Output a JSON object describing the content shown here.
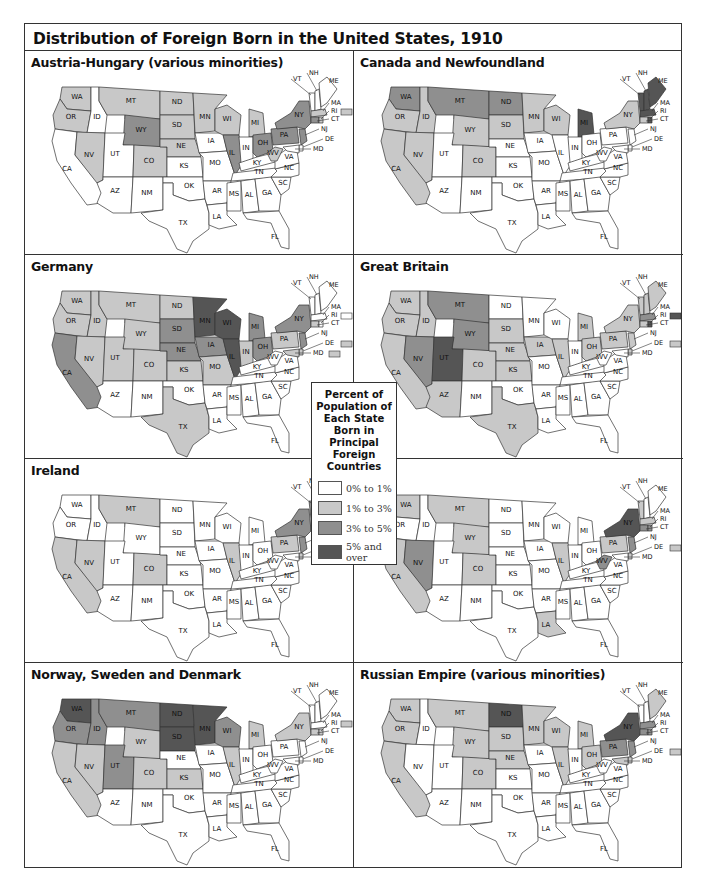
{
  "title": "Distribution of Foreign Born in the United States, 1910",
  "legend": {
    "title_lines": [
      "Percent of",
      "Population of",
      "Each State",
      "Born in",
      "Principal",
      "Foreign",
      "Countries"
    ],
    "items": [
      {
        "label": "0% to 1%",
        "color": "#ffffff"
      },
      {
        "label": "1% to 3%",
        "color": "#c8c8c8"
      },
      {
        "label": "3% to 5%",
        "color": "#8f8f8f"
      },
      {
        "label": "5% and over",
        "color": "#555555"
      }
    ]
  },
  "chart_data": {
    "type": "choropleth",
    "title": "Distribution of Foreign Born in the United States, 1910",
    "legend": [
      "0% to 1%",
      "1% to 3%",
      "3% to 5%",
      "5% and over"
    ],
    "level_key": {
      "0": "0% to 1%",
      "1": "1% to 3%",
      "2": "3% to 5%",
      "3": "5% and over"
    },
    "maps": [
      {
        "name": "Austria-Hungary (various minorities)",
        "levels": {
          "WA": 1,
          "OR": 1,
          "MT": 1,
          "ND": 1,
          "SD": 1,
          "MN": 1,
          "WI": 1,
          "MI": 1,
          "NV": 1,
          "CO": 1,
          "NE": 1,
          "WV": 1,
          "MA": 1,
          "RI": 1,
          "WY": 2,
          "IL": 2,
          "OH": 2,
          "PA": 2,
          "NY": 2,
          "CT": 2,
          "NJ": 2
        }
      },
      {
        "name": "Canada and Newfoundland",
        "levels": {
          "OR": 1,
          "ID": 1,
          "CA": 1,
          "NV": 1,
          "WY": 1,
          "CO": 1,
          "SD": 1,
          "MN": 1,
          "WI": 1,
          "NY": 1,
          "CT": 1,
          "WA": 2,
          "MT": 2,
          "ND": 2,
          "MI": 3,
          "ME": 3,
          "NH": 3,
          "VT": 3,
          "MA": 3,
          "RI": 3
        }
      },
      {
        "name": "Germany",
        "levels": {
          "WA": 1,
          "OR": 1,
          "ID": 1,
          "MT": 1,
          "ND": 1,
          "WY": 1,
          "NV": 1,
          "UT": 1,
          "CO": 1,
          "KS": 1,
          "MO": 1,
          "IN": 1,
          "PA": 1,
          "TX": 1,
          "CT": 1,
          "DE": 1,
          "MD": 1,
          "CA": 2,
          "SD": 2,
          "NE": 2,
          "IA": 2,
          "MI": 2,
          "OH": 2,
          "NY": 2,
          "NJ": 2,
          "MN": 3,
          "WI": 3,
          "IL": 3
        }
      },
      {
        "name": "Great Britain",
        "levels": {
          "WA": 1,
          "OR": 1,
          "ID": 1,
          "CA": 1,
          "AZ": 1,
          "CO": 1,
          "SD": 1,
          "NE": 1,
          "KS": 1,
          "IA": 1,
          "MI": 1,
          "IL": 1,
          "OH": 1,
          "PA": 1,
          "NY": 1,
          "NJ": 1,
          "VT": 1,
          "NH": 1,
          "ME": 1,
          "CT": 1,
          "DE": 1,
          "TX": 1,
          "MT": 2,
          "WY": 2,
          "NV": 2,
          "MA": 2,
          "UT": 3,
          "RI": 3
        }
      },
      {
        "name": "Ireland",
        "levels": {
          "MT": 1,
          "CA": 1,
          "NV": 1,
          "CO": 1,
          "IL": 1,
          "PA": 1,
          "ME": 1,
          "NH": 1,
          "DE": 1,
          "NY": 2,
          "VT": 2,
          "NJ": 2,
          "MA": 3,
          "RI": 3,
          "CT": 3
        }
      },
      {
        "name": "Italy",
        "levels": {
          "WA": 1,
          "MT": 1,
          "WY": 1,
          "CO": 1,
          "CA": 1,
          "IL": 1,
          "PA": 1,
          "LA": 1,
          "VT": 1,
          "MA": 1,
          "DE": 1,
          "NV": 2,
          "WV": 2,
          "NJ": 2,
          "RI": 2,
          "CT": 2,
          "NY": 3
        }
      },
      {
        "name": "Norway, Sweden and Denmark",
        "levels": {
          "CA": 1,
          "NV": 1,
          "WY": 1,
          "CO": 1,
          "KS": 1,
          "MI": 1,
          "IL": 1,
          "NY": 1,
          "CT": 1,
          "RI": 1,
          "OR": 2,
          "ID": 2,
          "MT": 2,
          "UT": 2,
          "WI": 2,
          "WA": 3,
          "ND": 3,
          "SD": 3,
          "MN": 3
        }
      },
      {
        "name": "Russian Empire (various minorities)",
        "levels": {
          "WA": 1,
          "OR": 1,
          "CA": 1,
          "MT": 1,
          "WY": 1,
          "CO": 1,
          "SD": 1,
          "NE": 1,
          "MN": 1,
          "WI": 1,
          "MI": 1,
          "IL": 1,
          "OH": 1,
          "ME": 1,
          "DE": 1,
          "MD": 1,
          "PA": 2,
          "NJ": 2,
          "MA": 2,
          "RI": 2,
          "CT": 2,
          "ND": 3,
          "NY": 3
        }
      }
    ]
  },
  "panels": [
    {
      "title": "Austria-Hungary (various minorities)"
    },
    {
      "title": "Canada and Newfoundland"
    },
    {
      "title": "Germany"
    },
    {
      "title": "Great Britain"
    },
    {
      "title": "Ireland"
    },
    {
      "title": "Italy"
    },
    {
      "title": "Norway, Sweden and Denmark"
    },
    {
      "title": "Russian Empire (various minorities)"
    }
  ],
  "inset_boxes": {
    "0": {
      "RI": 1
    },
    "1": {},
    "2": {
      "RI": 0,
      "DE": 1,
      "MD": 1
    },
    "3": {
      "RI": 3,
      "DE": 1
    },
    "4": {
      "DE": 1
    },
    "5": {
      "DE": 1
    },
    "6": {
      "RI": 1
    },
    "7": {
      "DE": 1
    }
  }
}
